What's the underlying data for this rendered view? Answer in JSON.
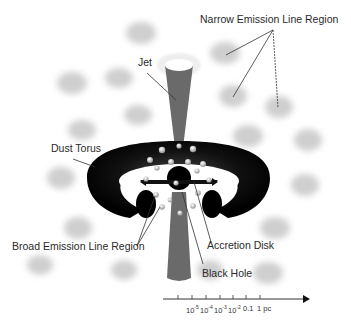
{
  "diagram": {
    "labels": {
      "nlr": "Narrow Emission Line Region",
      "jet": "Jet",
      "dust_torus": "Dust Torus",
      "blr": "Broad Emission Line Region",
      "accretion_disk": "Accretion Disk",
      "black_hole": "Black Hole"
    },
    "scale": {
      "ticks": [
        {
          "base": "10",
          "exp": "-5"
        },
        {
          "base": "10",
          "exp": "-4"
        },
        {
          "base": "10",
          "exp": "-3"
        },
        {
          "base": "10",
          "exp": "-2"
        },
        {
          "base": "0.1",
          "exp": ""
        },
        {
          "base": "1 pc",
          "exp": ""
        }
      ]
    },
    "colors": {
      "torus": "#111111",
      "jet": "#6a6a6a",
      "clouds": "#d4d4d4",
      "text": "#2a2a2a"
    }
  }
}
